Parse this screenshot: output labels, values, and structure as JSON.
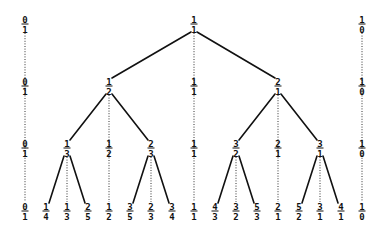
{
  "colors": {
    "ink": "#111111",
    "guide": "#333333",
    "background": "#ffffff"
  },
  "layout": {
    "row_y": [
      24,
      86,
      148,
      211
    ],
    "column_x": {
      "0/1": 25,
      "1/4": 46,
      "1/3": 67,
      "2/5": 88,
      "1/2": 109,
      "3/5": 130,
      "2/3": 151,
      "3/4": 172,
      "1/1": 194,
      "4/3": 215,
      "3/2": 236,
      "5/3": 257,
      "2/1": 278,
      "5/2": 299,
      "3/1": 320,
      "4/1": 341,
      "1/0": 362
    }
  },
  "rows": [
    {
      "level": 0,
      "fractions": [
        {
          "n": "0",
          "d": "1"
        },
        {
          "n": "1",
          "d": "1"
        },
        {
          "n": "1",
          "d": "0"
        }
      ]
    },
    {
      "level": 1,
      "fractions": [
        {
          "n": "0",
          "d": "1"
        },
        {
          "n": "1",
          "d": "2"
        },
        {
          "n": "1",
          "d": "1"
        },
        {
          "n": "2",
          "d": "1"
        },
        {
          "n": "1",
          "d": "0"
        }
      ]
    },
    {
      "level": 2,
      "fractions": [
        {
          "n": "0",
          "d": "1"
        },
        {
          "n": "1",
          "d": "3"
        },
        {
          "n": "1",
          "d": "2"
        },
        {
          "n": "2",
          "d": "3"
        },
        {
          "n": "1",
          "d": "1"
        },
        {
          "n": "3",
          "d": "2"
        },
        {
          "n": "2",
          "d": "1"
        },
        {
          "n": "3",
          "d": "1"
        },
        {
          "n": "1",
          "d": "0"
        }
      ]
    },
    {
      "level": 3,
      "fractions": [
        {
          "n": "0",
          "d": "1"
        },
        {
          "n": "1",
          "d": "4"
        },
        {
          "n": "1",
          "d": "3"
        },
        {
          "n": "2",
          "d": "5"
        },
        {
          "n": "1",
          "d": "2"
        },
        {
          "n": "3",
          "d": "5"
        },
        {
          "n": "2",
          "d": "3"
        },
        {
          "n": "3",
          "d": "4"
        },
        {
          "n": "1",
          "d": "1"
        },
        {
          "n": "4",
          "d": "3"
        },
        {
          "n": "3",
          "d": "2"
        },
        {
          "n": "5",
          "d": "3"
        },
        {
          "n": "2",
          "d": "1"
        },
        {
          "n": "5",
          "d": "2"
        },
        {
          "n": "3",
          "d": "1"
        },
        {
          "n": "4",
          "d": "1"
        },
        {
          "n": "1",
          "d": "0"
        }
      ]
    }
  ],
  "edges": [
    {
      "from": "1/1",
      "from_level": 0,
      "to": "1/2",
      "to_level": 1
    },
    {
      "from": "1/1",
      "from_level": 0,
      "to": "2/1",
      "to_level": 1
    },
    {
      "from": "1/2",
      "from_level": 1,
      "to": "1/3",
      "to_level": 2
    },
    {
      "from": "1/2",
      "from_level": 1,
      "to": "2/3",
      "to_level": 2
    },
    {
      "from": "2/1",
      "from_level": 1,
      "to": "3/2",
      "to_level": 2
    },
    {
      "from": "2/1",
      "from_level": 1,
      "to": "3/1",
      "to_level": 2
    },
    {
      "from": "1/3",
      "from_level": 2,
      "to": "1/4",
      "to_level": 3
    },
    {
      "from": "1/3",
      "from_level": 2,
      "to": "2/5",
      "to_level": 3
    },
    {
      "from": "2/3",
      "from_level": 2,
      "to": "3/5",
      "to_level": 3
    },
    {
      "from": "2/3",
      "from_level": 2,
      "to": "3/4",
      "to_level": 3
    },
    {
      "from": "3/2",
      "from_level": 2,
      "to": "4/3",
      "to_level": 3
    },
    {
      "from": "3/2",
      "from_level": 2,
      "to": "5/3",
      "to_level": 3
    },
    {
      "from": "3/1",
      "from_level": 2,
      "to": "5/2",
      "to_level": 3
    },
    {
      "from": "3/1",
      "from_level": 2,
      "to": "4/1",
      "to_level": 3
    }
  ],
  "guides": [
    {
      "column": "0/1",
      "from_level": 0,
      "to_level": 3
    },
    {
      "column": "1/0",
      "from_level": 0,
      "to_level": 3
    },
    {
      "column": "1/1",
      "from_level": 0,
      "to_level": 3
    },
    {
      "column": "1/2",
      "from_level": 1,
      "to_level": 3
    },
    {
      "column": "2/1",
      "from_level": 1,
      "to_level": 3
    },
    {
      "column": "1/3",
      "from_level": 2,
      "to_level": 3
    },
    {
      "column": "2/3",
      "from_level": 2,
      "to_level": 3
    },
    {
      "column": "3/2",
      "from_level": 2,
      "to_level": 3
    },
    {
      "column": "3/1",
      "from_level": 2,
      "to_level": 3
    }
  ]
}
